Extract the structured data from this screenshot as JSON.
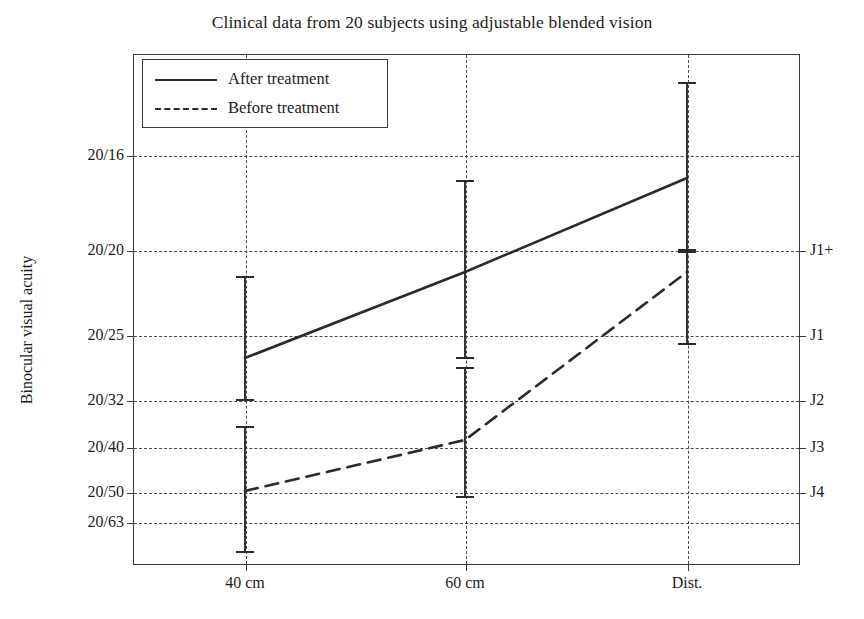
{
  "chart_data": {
    "type": "line",
    "title": "Clinical data from 20 subjects using adjustable blended vision",
    "xlabel": "",
    "ylabel": "Binocular visual acuity",
    "categories": [
      "40 cm",
      "60 cm",
      "Dist."
    ],
    "grid": true,
    "legend_position": "upper-left",
    "y_axis": {
      "label": "Binocular visual acuity",
      "tick_labels": [
        "20/16",
        "20/20",
        "20/25",
        "20/32",
        "20/40",
        "20/50",
        "20/63"
      ],
      "ticks_px": [
        155,
        250,
        335,
        400,
        447,
        492,
        522
      ],
      "inverted": true,
      "note": "Snellen notation; better acuity plotted higher"
    },
    "y_axis_secondary": {
      "tick_labels": [
        "J1+",
        "J1",
        "J2",
        "J3",
        "J4"
      ],
      "ticks_px": [
        250,
        335,
        400,
        447,
        492
      ],
      "aligned_to": [
        "20/20",
        "20/25",
        "20/32",
        "20/40",
        "20/50"
      ],
      "note": "Jaeger near-vision equivalents"
    },
    "x_ticks_px": [
      245,
      465,
      687
    ],
    "series": [
      {
        "name": "After treatment",
        "style": "solid",
        "color": "#2b2b2b",
        "values": [
          "20/23",
          "20/21",
          "20/17"
        ],
        "values_px": [
          358,
          272,
          178
        ],
        "error_bars": [
          {
            "category": "40 cm",
            "upper": "20/21",
            "lower": "20/32",
            "upper_px": 277,
            "lower_px": 400
          },
          {
            "category": "60 cm",
            "upper": "20/17",
            "lower": "20/27",
            "upper_px": 181,
            "lower_px": 358
          },
          {
            "category": "Dist.",
            "upper": "20/13",
            "lower": "20/20",
            "upper_px": 83,
            "lower_px": 252
          }
        ]
      },
      {
        "name": "Before treatment",
        "style": "dashed",
        "color": "#2b2b2b",
        "values": [
          "20/50",
          "20/39",
          "20/21"
        ],
        "values_px": [
          491,
          440,
          272
        ],
        "error_bars": [
          {
            "category": "40 cm",
            "upper": "20/36",
            "lower": "below 20/63",
            "upper_px": 427,
            "lower_px": 552
          },
          {
            "category": "60 cm",
            "upper": "20/30",
            "lower": "20/54",
            "upper_px": 368,
            "lower_px": 497
          },
          {
            "category": "Dist.",
            "upper": "20/20",
            "lower": "20/26",
            "upper_px": 250,
            "lower_px": 344
          }
        ]
      }
    ]
  },
  "legend": {
    "items": [
      {
        "label": "After treatment",
        "style": "solid"
      },
      {
        "label": "Before treatment",
        "style": "dashed"
      }
    ]
  }
}
